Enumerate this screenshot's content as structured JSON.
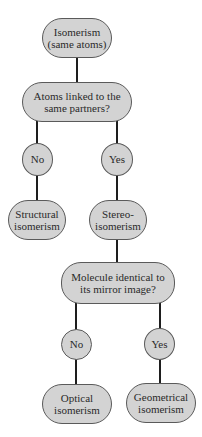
{
  "diagram": {
    "type": "decision-tree",
    "colors": {
      "node_fill": "#d3d3d3",
      "node_border": "#5a5a5a",
      "connector": "#1e1e1e",
      "text": "#2a2a2a",
      "background": "#ffffff"
    },
    "nodes": {
      "root": {
        "line1": "Isomerism",
        "line2": "(same atoms)"
      },
      "q1": {
        "line1": "Atoms linked to the",
        "line2": "same partners?"
      },
      "q1_no": {
        "label": "No"
      },
      "q1_yes": {
        "label": "Yes"
      },
      "structural": {
        "line1": "Structural",
        "line2": "isomerism"
      },
      "stereo": {
        "line1": "Stereo-",
        "line2": "isomerism"
      },
      "q2": {
        "line1": "Molecule identical to",
        "line2": "its mirror image?"
      },
      "q2_no": {
        "label": "No"
      },
      "q2_yes": {
        "label": "Yes"
      },
      "optical": {
        "line1": "Optical",
        "line2": "isomerism"
      },
      "geometrical": {
        "line1": "Geometrical",
        "line2": "isomerism"
      }
    },
    "edges": [
      [
        "root",
        "q1"
      ],
      [
        "q1",
        "q1_no"
      ],
      [
        "q1",
        "q1_yes"
      ],
      [
        "q1_no",
        "structural"
      ],
      [
        "q1_yes",
        "stereo"
      ],
      [
        "stereo",
        "q2"
      ],
      [
        "q2",
        "q2_no"
      ],
      [
        "q2",
        "q2_yes"
      ],
      [
        "q2_no",
        "optical"
      ],
      [
        "q2_yes",
        "geometrical"
      ]
    ]
  }
}
